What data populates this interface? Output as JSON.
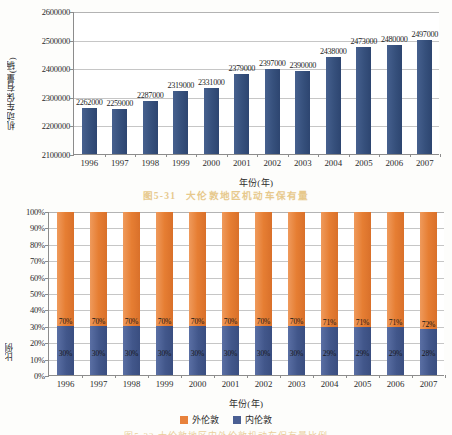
{
  "caption": {
    "number": "图5-31",
    "text": "大伦敦地区机动车保有量"
  },
  "footer": {
    "text": "图5-32   大伦敦地区内外伦敦机动车保有量比例"
  },
  "chart_data": [
    {
      "type": "bar",
      "title": "",
      "xlabel": "年份(年)",
      "ylabel": "机动车保有量(辆)",
      "categories": [
        "1996",
        "1997",
        "1998",
        "1999",
        "2000",
        "2001",
        "2002",
        "2003",
        "2004",
        "2005",
        "2006",
        "2007"
      ],
      "values": [
        2262000,
        2259000,
        2287000,
        2319000,
        2331000,
        2379000,
        2397000,
        2390000,
        2438000,
        2473000,
        2480000,
        2497000
      ],
      "data_labels": [
        "2262000",
        "2259000",
        "2287000",
        "2319000",
        "2331000",
        "2379000",
        "2397000",
        "2390000",
        "2438000",
        "2473000",
        "2480000",
        "2497000"
      ],
      "ylim": [
        2100000,
        2600000
      ],
      "yticks": [
        2100000,
        2200000,
        2300000,
        2400000,
        2500000,
        2600000
      ],
      "ytick_labels": [
        "2100000",
        "2200000",
        "2300000",
        "2400000",
        "2500000",
        "2600000"
      ],
      "grid": true,
      "legend": "none",
      "series_color": "#3b5482"
    },
    {
      "type": "bar",
      "stacked": true,
      "title": "",
      "xlabel": "年份(年)",
      "ylabel": "比例",
      "categories": [
        "1996",
        "1997",
        "1998",
        "1999",
        "2000",
        "2001",
        "2002",
        "2003",
        "2004",
        "2005",
        "2006",
        "2007"
      ],
      "series": [
        {
          "name": "外伦敦",
          "color": "#e8823c",
          "values": [
            70,
            70,
            70,
            70,
            70,
            70,
            70,
            70,
            71,
            71,
            71,
            72
          ],
          "labels": [
            "70%",
            "70%",
            "70%",
            "70%",
            "70%",
            "70%",
            "70%",
            "70%",
            "71%",
            "71%",
            "71%",
            "72%"
          ]
        },
        {
          "name": "内伦敦",
          "color": "#4a5f93",
          "values": [
            30,
            30,
            30,
            30,
            30,
            30,
            30,
            30,
            29,
            29,
            29,
            28
          ],
          "labels": [
            "30%",
            "30%",
            "30%",
            "30%",
            "30%",
            "30%",
            "30%",
            "30%",
            "29%",
            "29%",
            "29%",
            "28%"
          ]
        }
      ],
      "ylim": [
        0,
        100
      ],
      "yticks": [
        0,
        10,
        20,
        30,
        40,
        50,
        60,
        70,
        80,
        90,
        100
      ],
      "ytick_labels": [
        "0%",
        "10%",
        "20%",
        "30%",
        "40%",
        "50%",
        "60%",
        "70%",
        "80%",
        "90%",
        "100%"
      ],
      "grid": true,
      "legend_position": "bottom"
    }
  ]
}
